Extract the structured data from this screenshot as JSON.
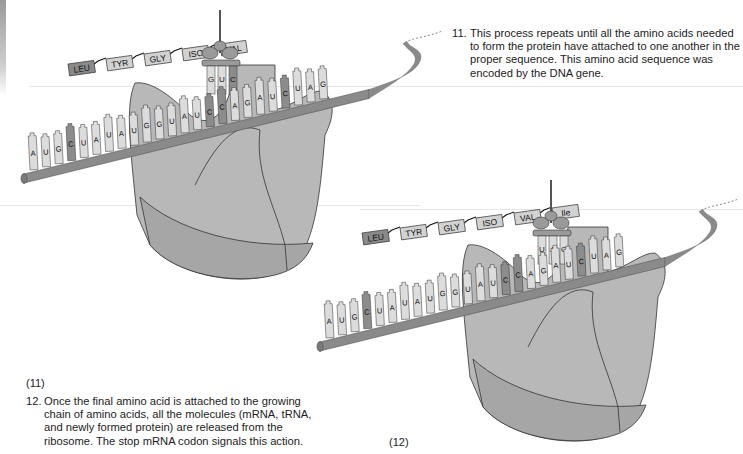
{
  "colors": {
    "ribosome_fill": "#b8b8b8",
    "ribosome_dark": "#a6a6a6",
    "mrna_rod": "#8a8a8a",
    "base_light": "#dcdcdc",
    "base_dark": "#8c8c8c",
    "amino_dark": "#8a8a8a",
    "amino_light": "#d2d2d2",
    "outline": "#333333"
  },
  "steps": [
    {
      "number": "11.",
      "text_lines": [
        "This process repeats until all the amino acids needed",
        "to form the protein have attached to one another in the",
        "proper sequence. This amino acid sequence was",
        "encoded by the DNA gene."
      ]
    },
    {
      "number": "12.",
      "text_lines": [
        "Once the final amino acid is attached to the growing",
        "chain of amino acids, all the molecules (mRNA, tRNA,",
        "and newly formed protein) are released from the",
        "ribosome. The stop mRNA codon signals this action."
      ]
    }
  ],
  "figures": [
    {
      "label": "(11)",
      "amino_acids": [
        "LEU",
        "TYR",
        "GLY",
        "ISO",
        "VAL"
      ],
      "anticodon": [
        "G",
        "U",
        "C"
      ],
      "mrna_bases": [
        "A",
        "U",
        "G",
        "C",
        "U",
        "A",
        "U",
        "A",
        "U",
        "G",
        "G",
        "U",
        "A",
        "U",
        "C",
        "C",
        "A",
        "G",
        "A",
        "U",
        "C",
        "U",
        "A",
        "G"
      ]
    },
    {
      "label": "(12)",
      "amino_acids": [
        "LEU",
        "TYR",
        "GLY",
        "ISO",
        "VAL",
        "Ile"
      ],
      "anticodon": [
        "U",
        "A",
        "G"
      ],
      "mrna_bases": [
        "A",
        "U",
        "G",
        "C",
        "U",
        "A",
        "U",
        "A",
        "U",
        "G",
        "G",
        "U",
        "A",
        "U",
        "C",
        "C",
        "A",
        "G",
        "A",
        "U",
        "C",
        "U",
        "A",
        "G"
      ]
    }
  ]
}
